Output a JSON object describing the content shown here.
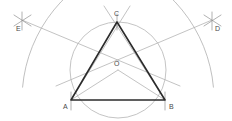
{
  "figure": {
    "width": 232,
    "height": 121,
    "background": "#ffffff",
    "colors": {
      "triangle_stroke": "#2b2b2b",
      "construction_stroke": "#a9a9a9",
      "arc_stroke": "#b0b0b0",
      "circle_stroke": "#b5b5b5",
      "label_text": "#4a4a4a",
      "tick_stroke": "#8f8f8f"
    },
    "points": [
      {
        "id": "A",
        "label": "A",
        "x": 71,
        "y": 100,
        "label_x": 63,
        "label_y": 103
      },
      {
        "id": "B",
        "label": "B",
        "x": 165,
        "y": 100,
        "label_x": 169,
        "label_y": 103
      },
      {
        "id": "C",
        "label": "C",
        "x": 117,
        "y": 22,
        "label_x": 114,
        "label_y": 10
      },
      {
        "id": "O",
        "label": "O",
        "x": 118,
        "y": 70,
        "label_x": 114,
        "label_y": 60
      },
      {
        "id": "D",
        "label": "D",
        "x": 212,
        "y": 20,
        "label_x": 215,
        "label_y": 25
      },
      {
        "id": "E",
        "label": "E",
        "x": 22,
        "y": 20,
        "label_x": 16,
        "label_y": 25
      }
    ],
    "triangle": {
      "name": "triangle-ABC",
      "vertices": [
        "A",
        "B",
        "C"
      ],
      "stroke_width": 1.6
    },
    "circumcircle": {
      "name": "circumcircle-O",
      "center": [
        118,
        70
      ],
      "radius": 48
    },
    "arcs": [
      {
        "name": "arc-centered-at-B",
        "center": [
          165,
          100
        ],
        "radius": 143,
        "start_deg": 185,
        "end_deg": 253
      },
      {
        "name": "arc-centered-at-A",
        "center": [
          71,
          100
        ],
        "radius": 143,
        "start_deg": 287,
        "end_deg": 355
      }
    ],
    "construction_lines": [
      {
        "name": "line-E-to-B",
        "from": [
          22,
          20
        ],
        "to": [
          180,
          86
        ]
      },
      {
        "name": "line-D-to-A",
        "from": [
          212,
          20
        ],
        "to": [
          56,
          86
        ]
      },
      {
        "name": "line-A-to-C-ext",
        "from": [
          71,
          100
        ],
        "to": [
          130,
          6
        ]
      },
      {
        "name": "line-B-to-C-ext",
        "from": [
          165,
          100
        ],
        "to": [
          104,
          6
        ]
      },
      {
        "name": "line-O-to-A",
        "from": [
          118,
          70
        ],
        "to": [
          71,
          100
        ]
      },
      {
        "name": "line-O-to-B",
        "from": [
          118,
          70
        ],
        "to": [
          165,
          100
        ]
      }
    ],
    "tick_marks": [
      {
        "name": "tick-E-vertical",
        "from": [
          22,
          12
        ],
        "to": [
          22,
          30
        ]
      },
      {
        "name": "tick-E-diagonal-1",
        "from": [
          14,
          15
        ],
        "to": [
          31,
          26
        ]
      },
      {
        "name": "tick-E-diagonal-2",
        "from": [
          14,
          26
        ],
        "to": [
          31,
          15
        ]
      },
      {
        "name": "tick-D-vertical",
        "from": [
          212,
          12
        ],
        "to": [
          212,
          30
        ]
      },
      {
        "name": "tick-D-diagonal-1",
        "from": [
          204,
          15
        ],
        "to": [
          221,
          26
        ]
      },
      {
        "name": "tick-D-diagonal-2",
        "from": [
          204,
          26
        ],
        "to": [
          221,
          15
        ]
      },
      {
        "name": "tick-C-vertical",
        "from": [
          117,
          14
        ],
        "to": [
          117,
          30
        ]
      },
      {
        "name": "tick-A-vertical",
        "from": [
          71,
          92
        ],
        "to": [
          71,
          110
        ]
      },
      {
        "name": "tick-B-vertical",
        "from": [
          165,
          92
        ],
        "to": [
          165,
          110
        ]
      }
    ]
  }
}
